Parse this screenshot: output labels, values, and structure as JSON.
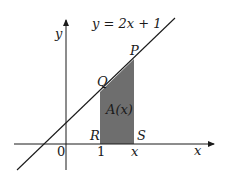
{
  "diagram": {
    "equation": "y = 2x + 1",
    "axis_labels": {
      "x": "x",
      "y": "y"
    },
    "tick_labels": {
      "origin": "0",
      "one": "1",
      "x": "x"
    },
    "points": {
      "P": "P",
      "Q": "Q",
      "R": "R",
      "S": "S"
    },
    "region_label": "A(x)",
    "colors": {
      "shade": "#6e6e6e",
      "line": "#1a1a1a",
      "background": "#ffffff"
    }
  }
}
